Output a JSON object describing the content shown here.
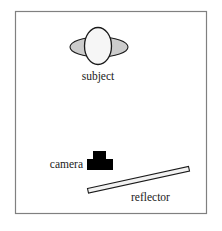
{
  "figure": {
    "type": "lighting-setup-diagram",
    "title": "",
    "background_color": "#ffffff",
    "frame": {
      "name": "diagram-frame",
      "x": 15,
      "y": 11,
      "width": 192,
      "height": 203,
      "stroke_color": "#808080",
      "fill_color": "#ffffff",
      "stroke_width": 1.2
    },
    "elements": [
      {
        "id": "subject",
        "label": "subject",
        "shape": "head-and-shoulders",
        "head": {
          "cx": 98,
          "cy": 46,
          "rx": 13.5,
          "ry": 18.5,
          "fill": "#f6f6f6",
          "stroke": "#1a1a1a"
        },
        "shoulders": {
          "cx": 99,
          "cy": 47,
          "rx": 29,
          "ry": 10,
          "fill": "#cccccc",
          "stroke": "#1a1a1a"
        },
        "label_x": 98,
        "label_y": 80,
        "label_anchor": "middle"
      },
      {
        "id": "camera",
        "label": "camera",
        "shape": "t-shape-black",
        "fill": "#000000",
        "body": {
          "x": 87,
          "y": 159,
          "width": 26,
          "height": 11
        },
        "lens": {
          "x": 93,
          "y": 151,
          "width": 13,
          "height": 8
        },
        "label_x": 83,
        "label_y": 168,
        "label_anchor": "end"
      },
      {
        "id": "reflector",
        "label": "reflector",
        "shape": "tilted-bar",
        "fill": "#f2f2f2",
        "stroke": "#1a1a1a",
        "left_point": {
          "x": 88,
          "y": 190
        },
        "right_point": {
          "x": 189,
          "y": 168
        },
        "thickness": 5,
        "label_x": 131,
        "label_y": 200,
        "label_anchor": "start"
      }
    ],
    "labels": {
      "subject": "subject",
      "camera": "camera",
      "reflector": "reflector"
    },
    "colors": {
      "frame_stroke": "#808080",
      "outline": "#1a1a1a",
      "head_fill": "#f6f6f6",
      "shoulder_fill": "#cccccc",
      "camera_fill": "#000000",
      "reflector_fill": "#f2f2f2",
      "text": "#1a1a1a",
      "page_background": "#ffffff"
    }
  }
}
